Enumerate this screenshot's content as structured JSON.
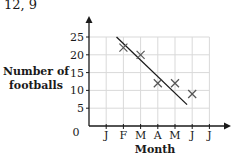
{
  "caption": "12, 9",
  "chart_data": {
    "type": "scatter",
    "title": "",
    "xlabel": "Month",
    "ylabel": "Number of footballs",
    "categories": [
      "J",
      "F",
      "M",
      "A",
      "M",
      "J",
      "J"
    ],
    "x_origin_label": "0",
    "yticks": [
      5,
      10,
      15,
      20,
      25
    ],
    "ylim": [
      0,
      25
    ],
    "grid": true,
    "series": [
      {
        "name": "Footballs",
        "marker": "x",
        "points": [
          {
            "month": "F",
            "x": 2,
            "y": 22
          },
          {
            "month": "M",
            "x": 3,
            "y": 20
          },
          {
            "month": "A",
            "x": 4,
            "y": 12
          },
          {
            "month": "M",
            "x": 5,
            "y": 12
          },
          {
            "month": "J",
            "x": 6,
            "y": 9
          }
        ]
      }
    ],
    "trend_line": {
      "x1": 1.6,
      "y1": 25,
      "x2": 5.7,
      "y2": 6
    }
  }
}
